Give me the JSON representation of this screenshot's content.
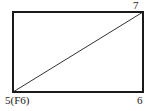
{
  "figure": {
    "type": "geometry-diagram",
    "background_color": "#ffffff",
    "stroke_color": "#1a1a1a",
    "rectangle": {
      "x": 13,
      "y": 12,
      "width": 130,
      "height": 80,
      "stroke_width": 1.4
    },
    "diagonal": {
      "x1": 13,
      "y1": 92,
      "x2": 143,
      "y2": 12,
      "stroke_width": 0.9
    },
    "vertex_labels": {
      "top_right": "7",
      "bottom_left": "5(F6)",
      "bottom_right": "6",
      "top_left": ""
    }
  }
}
